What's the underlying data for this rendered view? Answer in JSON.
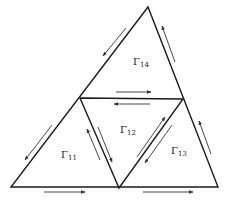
{
  "diagram": {
    "colors": {
      "stroke": "#1a1a1a",
      "arrow": "#333333",
      "background": "#ffffff"
    },
    "regions": [
      {
        "id": "r11",
        "symbol": "Γ",
        "subscript": "11"
      },
      {
        "id": "r12",
        "symbol": "Γ",
        "subscript": "12"
      },
      {
        "id": "r13",
        "symbol": "Γ",
        "subscript": "13"
      },
      {
        "id": "r14",
        "symbol": "Γ",
        "subscript": "14"
      }
    ],
    "vertices": {
      "apex": [
        148,
        7
      ],
      "left_mid": [
        80,
        98
      ],
      "right_mid": [
        183,
        99
      ],
      "bottom_left": [
        11,
        187
      ],
      "bottom_mid": [
        119,
        188
      ],
      "bottom_right": [
        218,
        187
      ]
    },
    "arrows": [
      {
        "id": "upper-left-edge",
        "direction": "down-left"
      },
      {
        "id": "upper-right-edge",
        "direction": "up"
      },
      {
        "id": "middle-top-edge",
        "direction": "right"
      },
      {
        "id": "middle-bottom-edge",
        "direction": "left"
      },
      {
        "id": "lower-left-edge",
        "direction": "down-left"
      },
      {
        "id": "inner-left-edge-up",
        "direction": "up"
      },
      {
        "id": "inner-left-edge-down",
        "direction": "down"
      },
      {
        "id": "inner-right-edge-up",
        "direction": "up"
      },
      {
        "id": "inner-right-edge-down",
        "direction": "down"
      },
      {
        "id": "lower-right-edge",
        "direction": "up"
      },
      {
        "id": "bottom-left-edge",
        "direction": "right"
      },
      {
        "id": "bottom-right-edge",
        "direction": "right"
      }
    ]
  }
}
